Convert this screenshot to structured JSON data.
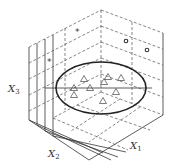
{
  "figure": {
    "axes": [
      {
        "id": "x1",
        "label": "X",
        "subscript": "1",
        "position": "bottom-right"
      },
      {
        "id": "x2",
        "label": "X",
        "subscript": "2",
        "position": "bottom-left"
      },
      {
        "id": "x3",
        "label": "X",
        "subscript": "3",
        "position": "left"
      }
    ],
    "markers": {
      "triangles": [
        {
          "x": 84,
          "y": 79
        },
        {
          "x": 104,
          "y": 82
        },
        {
          "x": 108,
          "y": 77
        },
        {
          "x": 121,
          "y": 78
        },
        {
          "x": 74,
          "y": 88
        },
        {
          "x": 90,
          "y": 88
        },
        {
          "x": 116,
          "y": 92
        },
        {
          "x": 74,
          "y": 95
        },
        {
          "x": 103,
          "y": 101
        }
      ],
      "asterisks": [
        {
          "x": 78,
          "y": 30
        },
        {
          "x": 50,
          "y": 60
        }
      ],
      "circles": [
        {
          "x": 126,
          "y": 41
        },
        {
          "x": 147,
          "y": 50
        }
      ]
    },
    "ellipse": {
      "cx": 101,
      "cy": 88,
      "rx": 45,
      "ry": 26
    },
    "colors": {
      "line": "#333333",
      "background": "#ffffff"
    }
  }
}
